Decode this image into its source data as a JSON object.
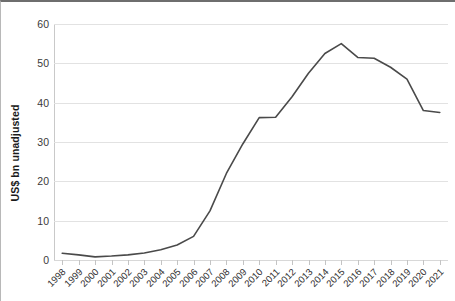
{
  "chart_data": {
    "type": "line",
    "title": "",
    "xlabel": "",
    "ylabel": "US$ bn unadjusted",
    "categories": [
      "1998",
      "1999",
      "2000",
      "2001",
      "2002",
      "2003",
      "2004",
      "2005",
      "2006",
      "2007",
      "2008",
      "2009",
      "2010",
      "2011",
      "2012",
      "2013",
      "2014",
      "2015",
      "2016",
      "2017",
      "2018",
      "2019",
      "2020",
      "2021"
    ],
    "values": [
      1.7,
      1.3,
      0.8,
      1.0,
      1.3,
      1.8,
      2.6,
      3.8,
      6.0,
      12.5,
      22.0,
      29.5,
      36.2,
      36.3,
      41.5,
      47.5,
      52.5,
      55.0,
      51.5,
      51.3,
      49.0,
      46.0,
      38.0,
      37.5
    ],
    "series": [
      {
        "name": "US$ bn unadjusted",
        "values": [
          1.7,
          1.3,
          0.8,
          1.0,
          1.3,
          1.8,
          2.6,
          3.8,
          6.0,
          12.5,
          22.0,
          29.5,
          36.2,
          36.3,
          41.5,
          47.5,
          52.5,
          55.0,
          51.5,
          51.3,
          49.0,
          46.0,
          38.0,
          37.5
        ],
        "color": "#4a4a4a"
      }
    ],
    "ylim": [
      0,
      60
    ],
    "yticks": [
      0,
      10,
      20,
      30,
      40,
      50,
      60
    ],
    "ytick_labels": [
      "0",
      "10",
      "20",
      "30",
      "40",
      "50",
      "60"
    ],
    "grid": true,
    "legend": false,
    "line_color": "#4a4a4a",
    "grid_color": "#e2e2e2"
  }
}
